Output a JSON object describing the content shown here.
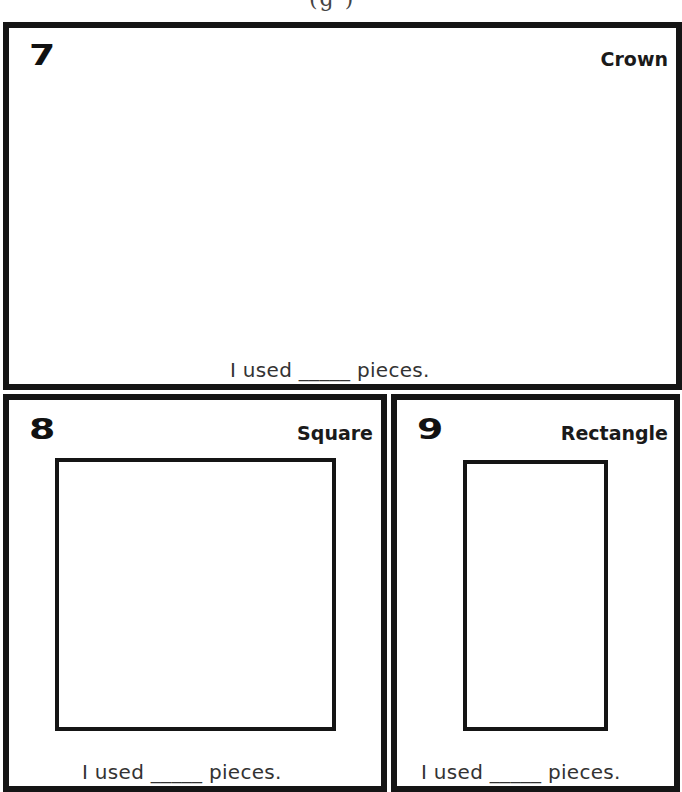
{
  "header": {
    "fragment": "ʻ(g )"
  },
  "panels": [
    {
      "number": "7",
      "title": "Crown",
      "used_text": "I used _____ pieces."
    },
    {
      "number": "8",
      "title": "Square",
      "used_text": "I used _____ pieces."
    },
    {
      "number": "9",
      "title": "Rectangle",
      "used_text": "I used _____ pieces."
    }
  ],
  "colors": {
    "outline": "#151515",
    "background": "#ffffff",
    "text": "#333333"
  }
}
